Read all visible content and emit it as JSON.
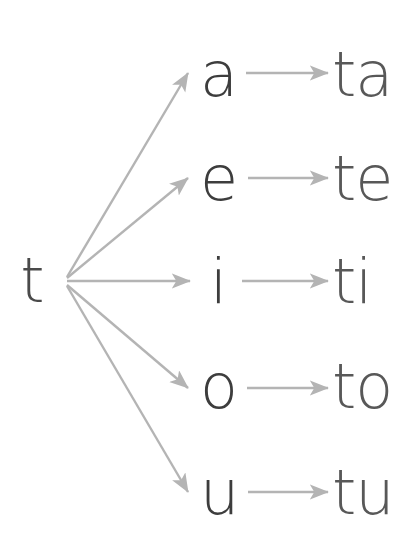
{
  "diagram": {
    "type": "syllable-formation-tree",
    "source": {
      "label": "t",
      "name": "consonant-t",
      "x": 32,
      "y": 302,
      "color": "#4a4a4a"
    },
    "fan_origin": {
      "x": 63,
      "y": 281
    },
    "colors": {
      "glyph_dark": "#3d3d3d",
      "glyph_medium": "#585858",
      "arrow": "#b4b4b4",
      "background": "#ffffff"
    },
    "rows": [
      {
        "id": "row-a",
        "vowel": "a",
        "syllable": "ta",
        "vowel_x": 200,
        "syllable_x": 332,
        "baseline_y": 96,
        "fan_arrow": {
          "x1": 67,
          "y1": 277,
          "x2": 188,
          "y2": 73
        },
        "link_arrow": {
          "x1": 246,
          "y1": 73,
          "x2": 328,
          "y2": 73
        }
      },
      {
        "id": "row-e",
        "vowel": "e",
        "syllable": "te",
        "vowel_x": 200,
        "syllable_x": 332,
        "baseline_y": 200,
        "fan_arrow": {
          "x1": 67,
          "y1": 278,
          "x2": 188,
          "y2": 178
        },
        "link_arrow": {
          "x1": 248,
          "y1": 178,
          "x2": 328,
          "y2": 178
        }
      },
      {
        "id": "row-i",
        "vowel": "i",
        "syllable": "ti",
        "vowel_x": 210,
        "syllable_x": 332,
        "baseline_y": 303,
        "fan_arrow": {
          "x1": 67,
          "y1": 281,
          "x2": 190,
          "y2": 281
        },
        "link_arrow": {
          "x1": 242,
          "y1": 281,
          "x2": 328,
          "y2": 281
        }
      },
      {
        "id": "row-o",
        "vowel": "o",
        "syllable": "to",
        "vowel_x": 200,
        "syllable_x": 332,
        "baseline_y": 408,
        "fan_arrow": {
          "x1": 67,
          "y1": 285,
          "x2": 188,
          "y2": 388
        },
        "link_arrow": {
          "x1": 247,
          "y1": 388,
          "x2": 328,
          "y2": 388
        }
      },
      {
        "id": "row-u",
        "vowel": "u",
        "syllable": "tu",
        "vowel_x": 200,
        "syllable_x": 332,
        "baseline_y": 514,
        "fan_arrow": {
          "x1": 67,
          "y1": 286,
          "x2": 188,
          "y2": 492
        },
        "link_arrow": {
          "x1": 248,
          "y1": 492,
          "x2": 328,
          "y2": 492
        }
      }
    ]
  }
}
